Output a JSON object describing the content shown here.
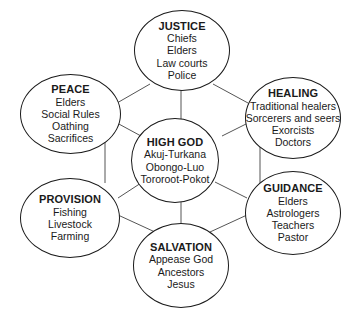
{
  "diagram": {
    "center": {
      "title": "HIGH GOD",
      "items": [
        "Akuj-Turkana",
        "Obongo-Luo",
        "Tororoot-Pokot"
      ]
    },
    "nodes": {
      "justice": {
        "title": "JUSTICE",
        "items": [
          "Chiefs",
          "Elders",
          "Law courts",
          "Police"
        ]
      },
      "healing": {
        "title": "HEALING",
        "items": [
          "Traditional healers",
          "Sorcerers and seers",
          "Exorcists",
          "Doctors"
        ]
      },
      "guidance": {
        "title": "GUIDANCE",
        "items": [
          "Elders",
          "Astrologers",
          "Teachers",
          "Pastor"
        ]
      },
      "salvation": {
        "title": "SALVATION",
        "items": [
          "Appease God",
          "Ancestors",
          "Jesus"
        ]
      },
      "provision": {
        "title": "PROVISION",
        "items": [
          "Fishing",
          "Livestock",
          "Farming"
        ]
      },
      "peace": {
        "title": "PEACE",
        "items": [
          "Elders",
          "Social Rules",
          "Oathing",
          "Sacrifices"
        ]
      }
    },
    "colors": {
      "line": "#555555",
      "border": "#1a1a1a",
      "text": "#1a1a1a",
      "background": "#ffffff"
    }
  }
}
